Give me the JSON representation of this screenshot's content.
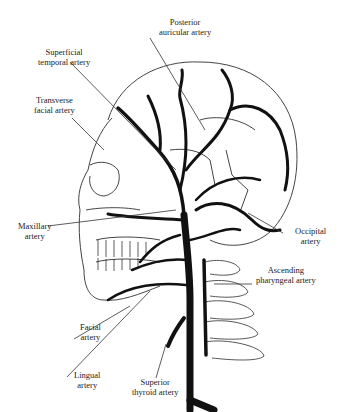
{
  "figure": {
    "type": "anatomical illustration",
    "caption_partial": "Figure ... (caption cut off at bottom edge)"
  },
  "labels": {
    "posterior_auricular": [
      "Posterior",
      "auricular artery"
    ],
    "superficial_temporal": [
      "Superficial",
      "temporal artery"
    ],
    "transverse_facial": [
      "Transverse",
      "facial artery"
    ],
    "maxillary": [
      "Maxillary",
      "artery"
    ],
    "occipital": [
      "Occipital",
      "artery"
    ],
    "ascending_pharyngeal": [
      "Ascending",
      "pharyngeal artery"
    ],
    "facial": [
      "Facial",
      "artery"
    ],
    "lingual": [
      "Lingual",
      "artery"
    ],
    "superior_thyroid": [
      "Superior",
      "thyroid artery"
    ]
  },
  "colors": {
    "ink": "#111111",
    "bone_line": "#555555",
    "background": "#ffffff"
  }
}
